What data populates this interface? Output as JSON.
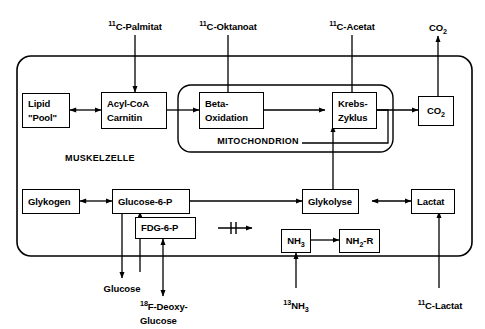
{
  "diagram": {
    "regions": [
      {
        "id": "muscle-cell",
        "label": "MUSKELZELLE"
      },
      {
        "id": "mitochondrion",
        "label": "MITOCHONDRION"
      }
    ],
    "tracer_labels_top": [
      {
        "id": "c11-palmitat",
        "sup": "11",
        "text": "C-Palmitat"
      },
      {
        "id": "c11-oktanoat",
        "sup": "11",
        "text": "C-Oktanoat"
      },
      {
        "id": "c11-acetat",
        "sup": "11",
        "text": "C-Acetat"
      },
      {
        "id": "co2-out",
        "sup": "",
        "text": "CO",
        "sub": "2"
      }
    ],
    "tracer_labels_bottom": [
      {
        "id": "glucose",
        "sup": "",
        "text": "Glucose"
      },
      {
        "id": "f18-deoxy-glucose",
        "sup": "18",
        "text": "F-Deoxy-",
        "text2": "Glucose"
      },
      {
        "id": "n13-ammonia",
        "sup": "13",
        "text": "NH",
        "sub": "3"
      },
      {
        "id": "c11-lactat",
        "sup": "11",
        "text": "C-Lactat"
      }
    ],
    "boxes": [
      {
        "id": "lipid-pool",
        "lines": [
          "Lipid",
          "\"Pool\""
        ]
      },
      {
        "id": "acyl-coa-carnitin",
        "lines": [
          "Acyl-CoA",
          "Carnitin"
        ]
      },
      {
        "id": "beta-oxidation",
        "lines": [
          "Beta-",
          "Oxidation"
        ]
      },
      {
        "id": "krebs-zyklus",
        "lines": [
          "Krebs-",
          "Zyklus"
        ]
      },
      {
        "id": "co2",
        "lines": [
          "CO2"
        ]
      },
      {
        "id": "glykogen",
        "lines": [
          "Glykogen"
        ]
      },
      {
        "id": "glucose-6-p",
        "lines": [
          "Glucose-6-P"
        ]
      },
      {
        "id": "fdg-6-p",
        "lines": [
          "FDG-6-P"
        ]
      },
      {
        "id": "glykolyse",
        "lines": [
          "Glykolyse"
        ]
      },
      {
        "id": "lactat",
        "lines": [
          "Lactat"
        ]
      },
      {
        "id": "nh3",
        "lines": [
          "NH3"
        ]
      },
      {
        "id": "nh2-r",
        "lines": [
          "NH2-R"
        ]
      }
    ],
    "colors": {
      "stroke": "#000000",
      "background": "#ffffff",
      "text": "#000000"
    }
  }
}
